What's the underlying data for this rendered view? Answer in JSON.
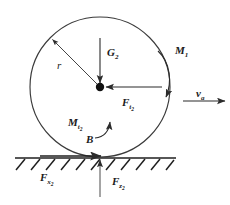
{
  "diagram": {
    "type": "free-body-diagram",
    "canvas": {
      "width": 230,
      "height": 205,
      "background": "#ffffff"
    },
    "stroke_color": "#2b2b2b",
    "text_color": "#1a1a1a",
    "body": {
      "shape": "circle",
      "name": "wheel",
      "center": {
        "x": 100,
        "y": 87
      },
      "radius": 70,
      "center_marker": "filled-dot"
    },
    "ground": {
      "name": "ground-surface",
      "y": 158,
      "x_start": 15,
      "x_end": 176,
      "hatching": "diagonal",
      "hatch_count": 11
    },
    "contact_point": {
      "x": 100,
      "y": 158,
      "label": "B"
    },
    "labels": {
      "weight": {
        "symbol": "G",
        "sub": "2",
        "text": "G2"
      },
      "driving_moment": {
        "symbol": "M",
        "sub": "1",
        "text": "M1"
      },
      "tangential_force": {
        "symbol": "F",
        "sub": "t",
        "sub2": "2",
        "text": "Ft2"
      },
      "resisting_moment": {
        "symbol": "M",
        "sub": "t",
        "sub2": "2",
        "text": "Mt2"
      },
      "contact": {
        "symbol": "B",
        "text": "B"
      },
      "radius": {
        "symbol": "r",
        "text": "r"
      },
      "velocity": {
        "symbol": "v",
        "sub": "a",
        "text": "va"
      },
      "friction_force": {
        "symbol": "F",
        "sub": "x",
        "sub2": "2",
        "text": "Fx2"
      },
      "normal_force": {
        "symbol": "F",
        "sub": "z",
        "sub2": "2",
        "text": "Fz2"
      }
    },
    "vectors": [
      {
        "name": "weight-arrow",
        "label": "G2",
        "direction": "down",
        "from": {
          "x": 100,
          "y": 40
        },
        "to": {
          "x": 100,
          "y": 85
        }
      },
      {
        "name": "tangential-force-arrow",
        "label": "Ft2",
        "direction": "left",
        "from": {
          "x": 160,
          "y": 87
        },
        "to": {
          "x": 105,
          "y": 87
        }
      },
      {
        "name": "radius-arrow",
        "label": "r",
        "direction": "upper-left",
        "from": {
          "x": 100,
          "y": 87
        },
        "to": {
          "x": 51,
          "y": 38
        }
      },
      {
        "name": "driving-moment-arc",
        "label": "M1",
        "direction": "clockwise",
        "arrowhead": "down"
      },
      {
        "name": "resisting-moment-arc",
        "label": "Mt2",
        "direction": "counter-clockwise",
        "arrowhead": "up"
      },
      {
        "name": "velocity-arrow",
        "label": "va",
        "direction": "right",
        "from": {
          "x": 183,
          "y": 101
        },
        "to": {
          "x": 224,
          "y": 101
        }
      },
      {
        "name": "friction-force-arrow",
        "label": "Fx2",
        "direction": "right",
        "from": {
          "x": 40,
          "y": 156
        },
        "to": {
          "x": 100,
          "y": 156
        }
      },
      {
        "name": "normal-force-arrow",
        "label": "Fz2",
        "direction": "up",
        "from": {
          "x": 100,
          "y": 196
        },
        "to": {
          "x": 100,
          "y": 159
        }
      }
    ]
  }
}
